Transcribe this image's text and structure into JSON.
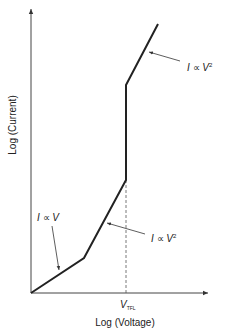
{
  "diagram": {
    "title": "",
    "axes": {
      "x_label": "Log (Voltage)",
      "y_label": "Log (Current)",
      "origin": [
        31,
        293
      ],
      "x_end": [
        209,
        293
      ],
      "y_end": [
        31,
        8
      ]
    },
    "curve": {
      "points": "31,293 84,258 126,180 126,85 158,24",
      "color": "#222222"
    },
    "threshold": {
      "label_main": "V",
      "label_sub": "TFL",
      "x": 126
    },
    "annotations": [
      {
        "id": "ohmic",
        "text_i": "I",
        "text_prop": " ∝ ",
        "text_v": "V",
        "text_exp": ""
      },
      {
        "id": "sclc-lower",
        "text_i": "I",
        "text_prop": " ∝ ",
        "text_v": "V",
        "text_exp": "2"
      },
      {
        "id": "sclc-upper",
        "text_i": "I",
        "text_prop": " ∝ ",
        "text_v": "V",
        "text_exp": "2"
      }
    ]
  }
}
